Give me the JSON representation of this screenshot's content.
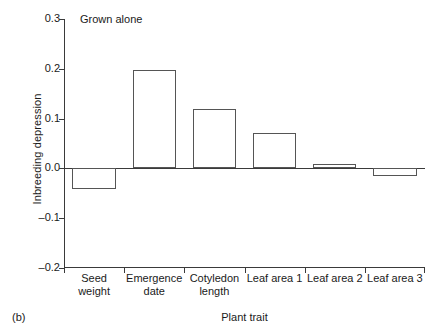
{
  "chart_data": {
    "type": "bar",
    "title": "Grown alone",
    "panel_label": "(b)",
    "xlabel": "Plant trait",
    "ylabel": "Inbreeding depression",
    "categories": [
      "Seed weight",
      "Emergence date",
      "Cotyledon length",
      "Leaf area 1",
      "Leaf area 2",
      "Leaf area 3"
    ],
    "category_lines": [
      [
        "Seed",
        "weight"
      ],
      [
        "Emergence",
        "date"
      ],
      [
        "Cotyledon",
        "length"
      ],
      [
        "Leaf area 1",
        ""
      ],
      [
        "Leaf area 2",
        ""
      ],
      [
        "Leaf area 3",
        ""
      ]
    ],
    "values": [
      -0.042,
      0.197,
      0.12,
      0.072,
      0.008,
      -0.015
    ],
    "ylim": [
      -0.2,
      0.3
    ],
    "yticks": [
      0.3,
      0.2,
      0.1,
      0.0,
      -0.1,
      -0.2
    ],
    "ytick_labels": [
      "0.3",
      "0.2",
      "0.1",
      "0.0",
      "–0.1",
      "–0.2"
    ],
    "grid": false,
    "legend": "none",
    "bar_fill": "#ffffff",
    "bar_stroke": "#555555",
    "axis_color": "#3a3a3a"
  }
}
